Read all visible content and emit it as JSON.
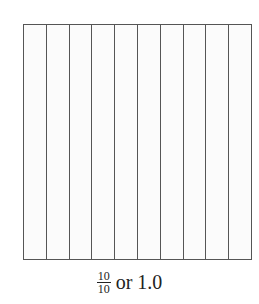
{
  "diagram": {
    "shape": "square divided into vertical strips",
    "strip_count": 10,
    "shaded_count": 0,
    "line_color": "#555555",
    "fill_color": "#fbfbfb"
  },
  "caption": {
    "numerator": "10",
    "denominator": "10",
    "rest": "or 1.0"
  }
}
